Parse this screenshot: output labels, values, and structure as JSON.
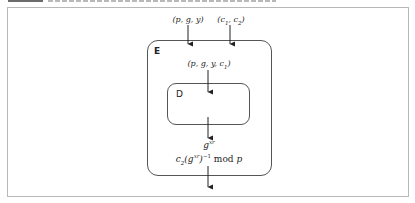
{
  "diagram": {
    "inputs": [
      {
        "id": "public-key",
        "label": "(p, g, y)"
      },
      {
        "id": "ciphertext",
        "label_main": "(c",
        "sub1": "1",
        "sep": ", c",
        "sub2": "2",
        "close": ")"
      }
    ],
    "outer_box": {
      "label": "E"
    },
    "inner_box": {
      "label": "D"
    },
    "intermediate": {
      "main": "(p, g, y, c",
      "sub": "1",
      "close": ")"
    },
    "d_output": {
      "base": "g",
      "exp": "xr"
    },
    "result": {
      "pre": "c",
      "pre_sub": "2",
      "open": "(g",
      "exp": "xr",
      "close": ")",
      "inv": "−1",
      "mod": " mod ",
      "modulus": "p"
    },
    "colors": {
      "stroke": "#222222",
      "box_border": "#555555",
      "frame": "#b8b8b8"
    }
  }
}
